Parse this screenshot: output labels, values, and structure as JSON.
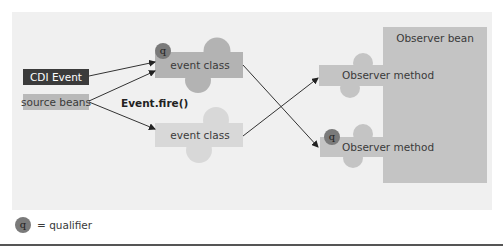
{
  "diagram": {
    "nodes": {
      "cdi_event": "CDI Event",
      "source_beans": "source beans",
      "event_fire": "Event.fire()",
      "event_class_qualified": "event class",
      "event_class_plain": "event class",
      "observer_bean": "Observer bean",
      "observer_method_top": "Observer method",
      "observer_method_bottom": "Observer method"
    },
    "qualifier_badge": "q",
    "edges": [
      {
        "from": "CDI Event",
        "to": "event class (qualified)"
      },
      {
        "from": "source beans",
        "to": "event class (qualified)"
      },
      {
        "from": "source beans",
        "to": "event class"
      },
      {
        "from": "event class (qualified)",
        "to": "Observer method (qualified)"
      },
      {
        "from": "event class",
        "to": "Observer method"
      }
    ],
    "colors": {
      "panel": "#f0f0f0",
      "cdi_event_fill": "#3b3b3b",
      "source_beans_fill": "#b9b9b9",
      "event_class_qualified_fill": "#b3b3b3",
      "event_class_plain_fill": "#d8d8d8",
      "observer_fill": "#c4c4c4",
      "qualifier_fill": "#7a7a7a",
      "edge": "#333333"
    }
  },
  "legend": {
    "symbol": "q",
    "label": "= qualifier"
  }
}
